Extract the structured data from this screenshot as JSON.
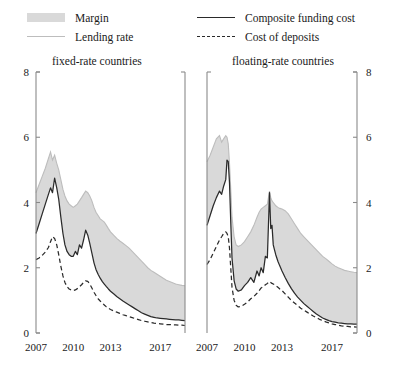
{
  "legend": {
    "items": [
      {
        "key": "margin",
        "label": "Margin",
        "marker": "filled-swatch",
        "color": "#d9d9d9",
        "column": "left"
      },
      {
        "key": "lending_rate",
        "label": "Lending rate",
        "marker": "solid-light-line",
        "color": "#bdbdbd",
        "column": "left"
      },
      {
        "key": "composite_funding_cost",
        "label": "Composite funding cost",
        "marker": "solid-dark-line",
        "color": "#2a2a2a",
        "column": "right"
      },
      {
        "key": "cost_of_deposits",
        "label": "Cost of deposits",
        "marker": "dashed-dark-line",
        "color": "#2a2a2a",
        "column": "right"
      }
    ]
  },
  "chart_data": [
    {
      "type": "area",
      "id": "fixed-rate-countries",
      "title": "fixed-rate countries",
      "xlabel": "",
      "ylabel": "",
      "xlim": [
        2007.0,
        2019.0
      ],
      "ylim": [
        0,
        8
      ],
      "xticks": [
        2007,
        2010,
        2013,
        2017
      ],
      "xtick_labels": [
        "2007",
        "2010",
        "2013",
        "2017"
      ],
      "yticks": [
        0,
        2,
        4,
        6,
        8
      ],
      "ytick_labels": [
        "0",
        "2",
        "4",
        "6",
        "8"
      ],
      "yaxis_position": "left",
      "grid": false,
      "legend_position": "above-figure",
      "band": {
        "name": "Margin",
        "upper_series": "Lending rate",
        "lower_series": "Composite funding cost",
        "color": "#d9d9d9"
      },
      "x": [
        2007.0,
        2007.25,
        2007.5,
        2007.75,
        2008.0,
        2008.17,
        2008.33,
        2008.5,
        2008.67,
        2008.83,
        2009.0,
        2009.17,
        2009.33,
        2009.5,
        2009.67,
        2009.83,
        2010.0,
        2010.17,
        2010.33,
        2010.5,
        2010.67,
        2010.83,
        2011.0,
        2011.17,
        2011.33,
        2011.5,
        2011.67,
        2011.83,
        2012.0,
        2012.17,
        2012.33,
        2012.5,
        2012.67,
        2012.83,
        2013.0,
        2013.25,
        2013.5,
        2013.75,
        2014.0,
        2014.25,
        2014.5,
        2014.75,
        2015.0,
        2015.25,
        2015.5,
        2015.75,
        2016.0,
        2016.25,
        2016.5,
        2016.75,
        2017.0,
        2017.25,
        2017.5,
        2017.75,
        2018.0,
        2018.25,
        2018.5,
        2018.75,
        2019.0
      ],
      "series": [
        {
          "name": "Lending rate",
          "color": "#bdbdbd",
          "style": "solid",
          "values": [
            4.3,
            4.55,
            4.8,
            5.05,
            5.35,
            5.55,
            5.3,
            5.45,
            5.2,
            5.0,
            4.7,
            4.4,
            4.2,
            4.05,
            3.95,
            3.9,
            3.85,
            3.9,
            3.95,
            4.05,
            4.15,
            4.25,
            4.35,
            4.3,
            4.2,
            4.05,
            3.85,
            3.7,
            3.6,
            3.5,
            3.45,
            3.4,
            3.3,
            3.2,
            3.1,
            3.0,
            2.9,
            2.82,
            2.75,
            2.68,
            2.6,
            2.5,
            2.4,
            2.3,
            2.2,
            2.1,
            2.0,
            1.92,
            1.86,
            1.8,
            1.74,
            1.68,
            1.62,
            1.58,
            1.54,
            1.5,
            1.48,
            1.46,
            1.45
          ]
        },
        {
          "name": "Composite funding cost",
          "color": "#2b2b2b",
          "style": "solid",
          "values": [
            3.05,
            3.35,
            3.65,
            3.95,
            4.25,
            4.45,
            4.3,
            4.75,
            4.45,
            4.1,
            3.55,
            3.05,
            2.7,
            2.5,
            2.4,
            2.35,
            2.35,
            2.5,
            2.4,
            2.7,
            2.6,
            2.85,
            3.15,
            3.0,
            2.75,
            2.45,
            2.15,
            1.95,
            1.8,
            1.68,
            1.58,
            1.5,
            1.42,
            1.35,
            1.28,
            1.2,
            1.12,
            1.05,
            0.98,
            0.92,
            0.86,
            0.8,
            0.74,
            0.68,
            0.62,
            0.58,
            0.54,
            0.5,
            0.48,
            0.46,
            0.45,
            0.44,
            0.43,
            0.42,
            0.41,
            0.4,
            0.4,
            0.39,
            0.38
          ]
        },
        {
          "name": "Cost of deposits",
          "color": "#2b2b2b",
          "style": "dashed",
          "values": [
            2.25,
            2.3,
            2.38,
            2.48,
            2.62,
            2.8,
            2.95,
            2.9,
            2.7,
            2.4,
            2.05,
            1.75,
            1.55,
            1.42,
            1.35,
            1.32,
            1.3,
            1.32,
            1.36,
            1.42,
            1.48,
            1.55,
            1.6,
            1.58,
            1.5,
            1.38,
            1.25,
            1.15,
            1.05,
            0.98,
            0.92,
            0.86,
            0.8,
            0.76,
            0.72,
            0.68,
            0.64,
            0.6,
            0.56,
            0.53,
            0.5,
            0.47,
            0.44,
            0.41,
            0.38,
            0.36,
            0.34,
            0.32,
            0.3,
            0.29,
            0.28,
            0.27,
            0.26,
            0.26,
            0.25,
            0.25,
            0.24,
            0.24,
            0.23
          ]
        }
      ]
    },
    {
      "type": "area",
      "id": "floating-rate-countries",
      "title": "floating-rate countries",
      "xlabel": "",
      "ylabel": "",
      "xlim": [
        2007.0,
        2019.0
      ],
      "ylim": [
        0,
        8
      ],
      "xticks": [
        2007,
        2010,
        2013,
        2017
      ],
      "xtick_labels": [
        "2007",
        "2010",
        "2013",
        "2017"
      ],
      "yticks": [
        0,
        2,
        4,
        6,
        8
      ],
      "ytick_labels": [
        "0",
        "2",
        "4",
        "6",
        "8"
      ],
      "yaxis_position": "right",
      "grid": false,
      "legend_position": "above-figure",
      "band": {
        "name": "Margin",
        "upper_series": "Lending rate",
        "lower_series": "Composite funding cost",
        "color": "#d9d9d9"
      },
      "x": [
        2007.0,
        2007.25,
        2007.5,
        2007.75,
        2008.0,
        2008.17,
        2008.33,
        2008.5,
        2008.6,
        2008.7,
        2008.8,
        2008.9,
        2009.0,
        2009.17,
        2009.33,
        2009.5,
        2009.75,
        2010.0,
        2010.25,
        2010.5,
        2010.75,
        2011.0,
        2011.17,
        2011.33,
        2011.5,
        2011.67,
        2011.83,
        2012.0,
        2012.1,
        2012.2,
        2012.3,
        2012.4,
        2012.5,
        2012.67,
        2012.83,
        2013.0,
        2013.25,
        2013.5,
        2013.75,
        2014.0,
        2014.25,
        2014.5,
        2014.75,
        2015.0,
        2015.25,
        2015.5,
        2015.75,
        2016.0,
        2016.25,
        2016.5,
        2016.75,
        2017.0,
        2017.25,
        2017.5,
        2017.75,
        2018.0,
        2018.25,
        2018.5,
        2018.75,
        2019.0
      ],
      "series": [
        {
          "name": "Lending rate",
          "color": "#bdbdbd",
          "style": "solid",
          "values": [
            5.25,
            5.45,
            5.7,
            5.95,
            6.05,
            5.85,
            5.95,
            6.05,
            6.0,
            5.8,
            5.2,
            4.4,
            3.55,
            2.95,
            2.7,
            2.65,
            2.7,
            2.8,
            2.95,
            3.1,
            3.3,
            3.55,
            3.7,
            3.8,
            3.85,
            3.9,
            3.95,
            4.35,
            4.15,
            4.05,
            4.0,
            3.95,
            3.9,
            3.85,
            3.82,
            3.8,
            3.75,
            3.65,
            3.5,
            3.35,
            3.2,
            3.05,
            2.95,
            2.85,
            2.75,
            2.65,
            2.55,
            2.45,
            2.35,
            2.28,
            2.2,
            2.12,
            2.05,
            2.0,
            1.96,
            1.92,
            1.9,
            1.88,
            1.86,
            1.85
          ]
        },
        {
          "name": "Composite funding cost",
          "color": "#2b2b2b",
          "style": "solid",
          "values": [
            3.3,
            3.6,
            3.9,
            4.15,
            4.35,
            4.25,
            4.5,
            4.7,
            5.3,
            5.25,
            4.6,
            3.4,
            2.3,
            1.6,
            1.35,
            1.28,
            1.32,
            1.45,
            1.55,
            1.7,
            1.55,
            1.9,
            1.75,
            2.0,
            1.85,
            2.35,
            2.3,
            4.3,
            3.2,
            3.3,
            2.7,
            2.55,
            2.4,
            2.2,
            2.05,
            1.9,
            1.7,
            1.52,
            1.36,
            1.22,
            1.1,
            1.0,
            0.9,
            0.82,
            0.74,
            0.66,
            0.58,
            0.52,
            0.46,
            0.42,
            0.38,
            0.35,
            0.33,
            0.31,
            0.3,
            0.29,
            0.28,
            0.28,
            0.27,
            0.27
          ]
        },
        {
          "name": "Cost of deposits",
          "color": "#2b2b2b",
          "style": "dashed",
          "values": [
            2.1,
            2.25,
            2.45,
            2.65,
            2.85,
            2.95,
            3.05,
            3.1,
            3.05,
            2.95,
            2.6,
            2.0,
            1.4,
            1.0,
            0.85,
            0.8,
            0.82,
            0.88,
            0.95,
            1.05,
            1.12,
            1.22,
            1.3,
            1.38,
            1.42,
            1.48,
            1.52,
            1.58,
            1.55,
            1.52,
            1.5,
            1.48,
            1.45,
            1.4,
            1.35,
            1.3,
            1.2,
            1.1,
            1.0,
            0.92,
            0.84,
            0.76,
            0.7,
            0.64,
            0.58,
            0.52,
            0.47,
            0.42,
            0.38,
            0.34,
            0.31,
            0.28,
            0.26,
            0.24,
            0.22,
            0.21,
            0.2,
            0.19,
            0.19,
            0.18
          ]
        }
      ]
    }
  ]
}
